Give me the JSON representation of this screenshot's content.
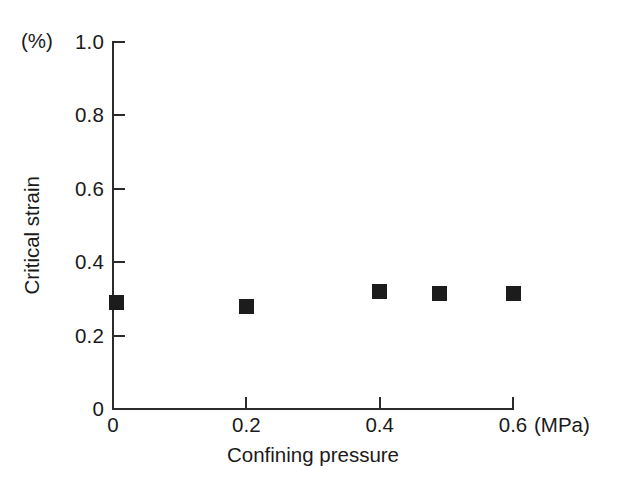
{
  "chart_data": {
    "type": "scatter",
    "title": "",
    "xlabel": "Confining pressure",
    "ylabel": "Critical strain",
    "x_unit": "(MPa)",
    "y_unit": "(%)",
    "xlim": [
      0,
      0.6
    ],
    "ylim": [
      0,
      1.0
    ],
    "grid": false,
    "legend": null,
    "marker_style": "filled-square",
    "marker_color": "#1c1c1c",
    "x_ticks": [
      "0",
      "0.2",
      "0.4",
      "0.6"
    ],
    "x_tick_values": [
      0,
      0.2,
      0.4,
      0.6
    ],
    "y_ticks": [
      "0",
      "0.2",
      "0.4",
      "0.6",
      "0.8",
      "1.0"
    ],
    "y_tick_values": [
      0,
      0.2,
      0.4,
      0.6,
      0.8,
      1.0
    ],
    "series": [
      {
        "name": "Critical strain",
        "points": [
          {
            "x": 0.005,
            "y": 0.29
          },
          {
            "x": 0.2,
            "y": 0.28
          },
          {
            "x": 0.4,
            "y": 0.32
          },
          {
            "x": 0.49,
            "y": 0.315
          },
          {
            "x": 0.6,
            "y": 0.315
          }
        ]
      }
    ]
  }
}
